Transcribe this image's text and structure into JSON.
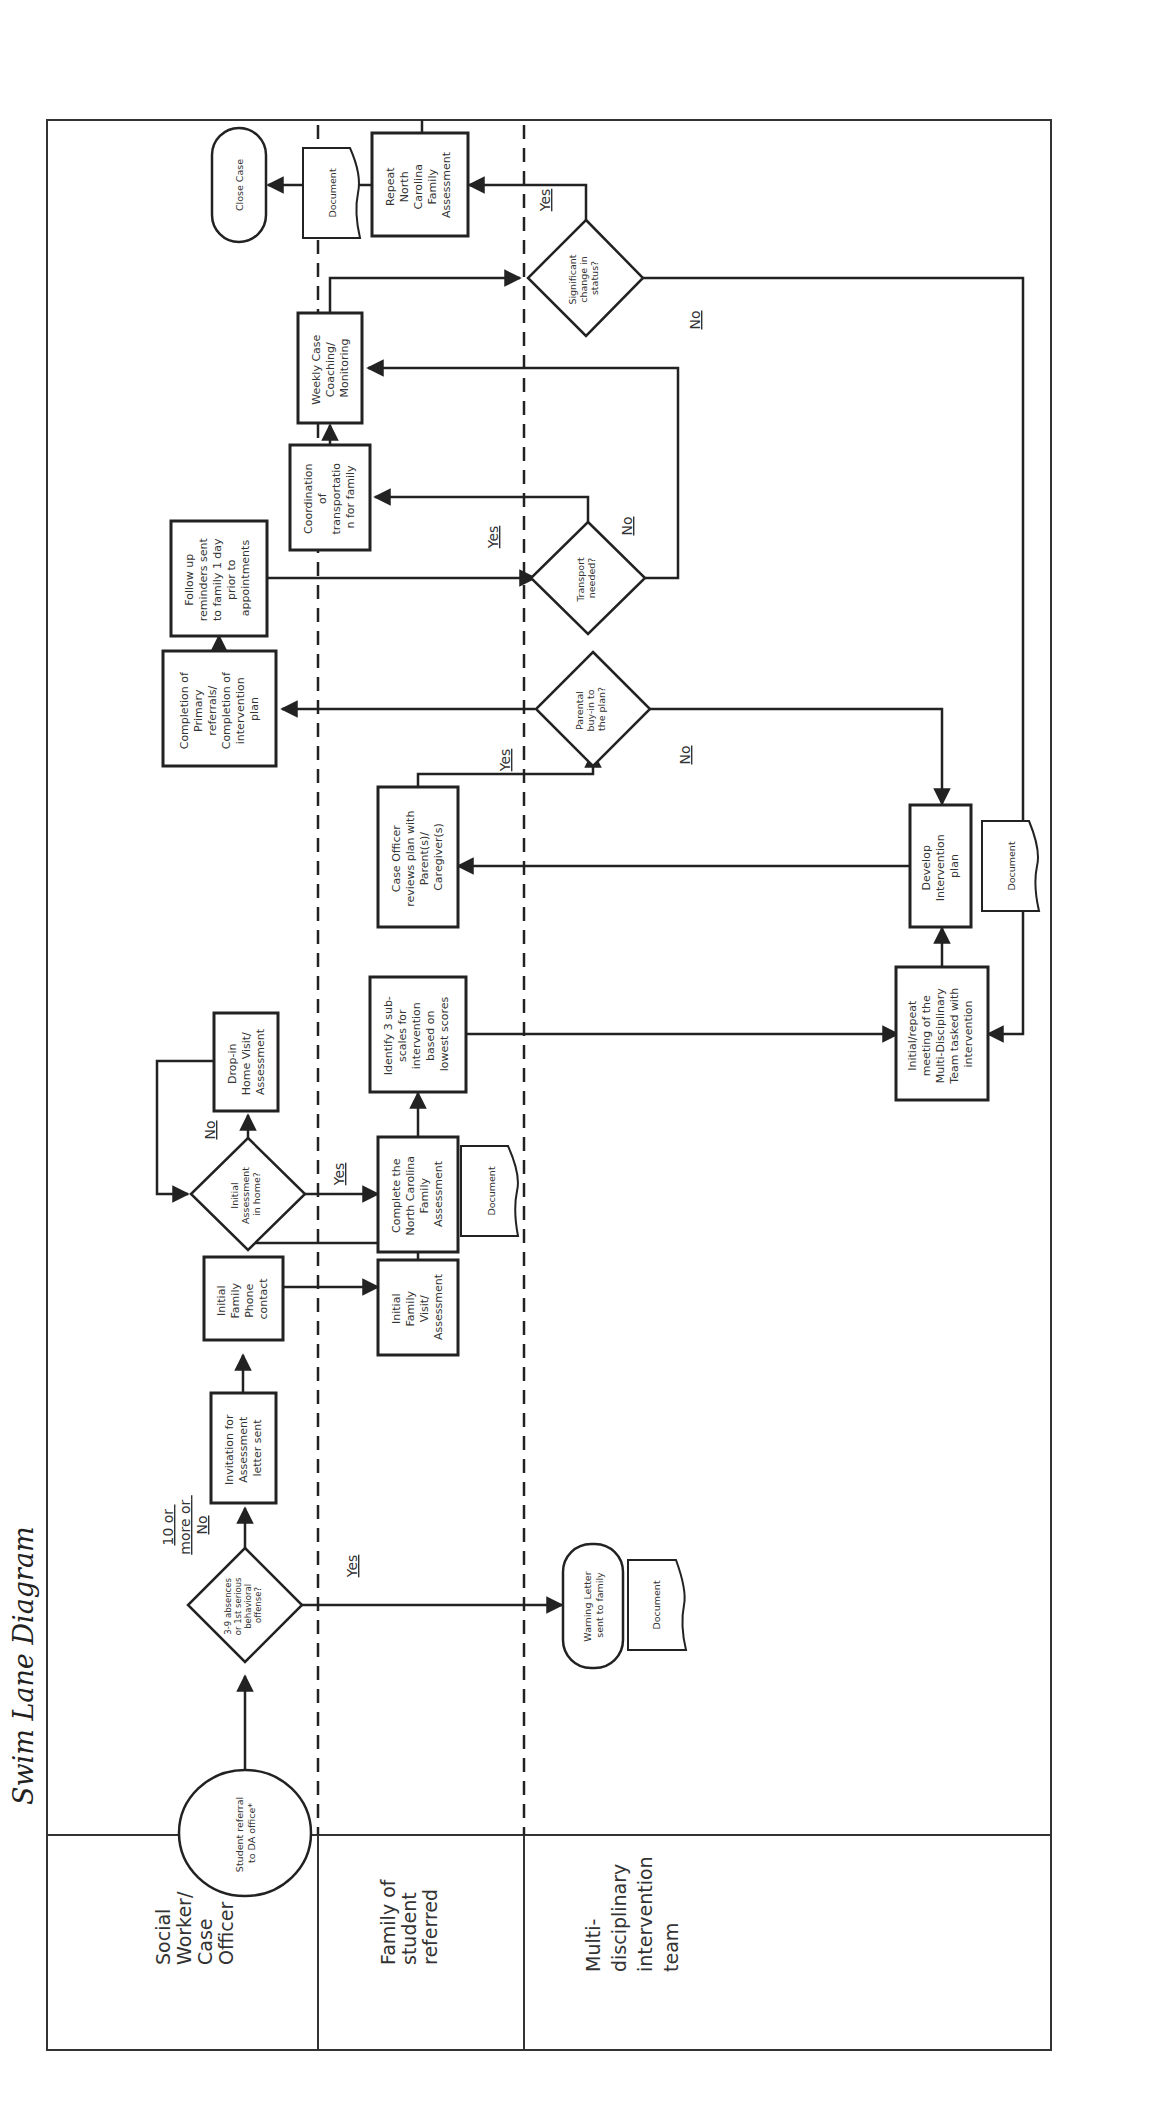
{
  "title": "Swim Lane Diagram",
  "lanes": [
    {
      "label": [
        "Social",
        "Worker/",
        "Case",
        "Officer"
      ]
    },
    {
      "label": [
        "Family of",
        "student",
        "referred"
      ]
    },
    {
      "label": [
        "Multi-",
        "disciplinary",
        "intervention",
        "team"
      ]
    }
  ],
  "nodes": {
    "start": {
      "shape": "circle",
      "lines": [
        "Student referral",
        "to DA office*"
      ]
    },
    "d_absences": {
      "shape": "diamond",
      "lines": [
        "3-9 absences",
        "or 1st serious",
        "behavioral",
        "offense?"
      ]
    },
    "invitation": {
      "shape": "process",
      "lines": [
        "Invitation for",
        "Assessment",
        "letter sent"
      ]
    },
    "phone": {
      "shape": "process",
      "lines": [
        "Initial",
        "Family",
        "Phone",
        "contact"
      ]
    },
    "visit": {
      "shape": "process",
      "lines": [
        "Initial",
        "Family",
        "Visit/",
        "Assessment"
      ]
    },
    "d_inhome": {
      "shape": "diamond",
      "lines": [
        "Initial",
        "Assessment",
        "in home?"
      ]
    },
    "dropin": {
      "shape": "process",
      "lines": [
        "Drop-in",
        "Home Visit/",
        "Assessment"
      ]
    },
    "ncfa": {
      "shape": "process",
      "lines": [
        "Complete the",
        "North Carolina",
        "Family",
        "Assessment"
      ]
    },
    "doc1": {
      "shape": "document",
      "lines": [
        "Document"
      ]
    },
    "identify": {
      "shape": "process",
      "lines": [
        "Identify 3 sub-",
        "scales for",
        "intervention",
        "based on",
        "lowest scores"
      ]
    },
    "review": {
      "shape": "process",
      "lines": [
        "Case Officer",
        "reviews plan with",
        "Parent(s)/",
        "Caregiver(s)"
      ]
    },
    "d_buyin": {
      "shape": "diamond",
      "lines": [
        "Parental",
        "buy-in to",
        "the plan?"
      ]
    },
    "completion": {
      "shape": "process",
      "lines": [
        "Completion of",
        "Primary",
        "referrals/",
        "Completion of",
        "intervention",
        "plan"
      ]
    },
    "followup": {
      "shape": "process",
      "lines": [
        "Follow up",
        "reminders sent",
        "to family 1 day",
        "prior to",
        "appointments"
      ]
    },
    "d_transport": {
      "shape": "diamond",
      "lines": [
        "Transport",
        "needed?"
      ]
    },
    "coordination": {
      "shape": "process",
      "lines": [
        "Coordination",
        "of",
        "transportatio",
        "n for family"
      ]
    },
    "weekly": {
      "shape": "process",
      "lines": [
        "Weekly Case",
        "Coaching/",
        "Monitoring"
      ]
    },
    "d_change": {
      "shape": "diamond",
      "lines": [
        "Significant",
        "change in",
        "status?"
      ]
    },
    "repeat": {
      "shape": "process",
      "lines": [
        "Repeat",
        "North",
        "Carolina",
        "Family",
        "Assessment"
      ]
    },
    "doc2": {
      "shape": "document",
      "lines": [
        "Document"
      ]
    },
    "close": {
      "shape": "terminator",
      "lines": [
        "Close Case"
      ]
    },
    "warning": {
      "shape": "terminator",
      "lines": [
        "Warning Letter",
        "sent to family"
      ]
    },
    "doc3": {
      "shape": "document",
      "lines": [
        "Document"
      ]
    },
    "mdt_meeting": {
      "shape": "process",
      "lines": [
        "Initial/repeat",
        "meeting of the",
        "Multi-Disciplinary",
        "Team tasked with",
        "intervention"
      ]
    },
    "develop": {
      "shape": "process",
      "lines": [
        "Develop",
        "Intervention",
        "plan"
      ]
    },
    "doc4": {
      "shape": "document",
      "lines": [
        "Document"
      ]
    }
  },
  "edge_labels": {
    "absences_no": [
      "10 or",
      "more or",
      "No"
    ],
    "absences_yes": "Yes",
    "inhome_no": "No",
    "inhome_yes": "Yes",
    "buyin_yes": "Yes",
    "buyin_no": "No",
    "transport_yes": "Yes",
    "transport_no": "No",
    "change_yes": "Yes",
    "change_no": "No"
  }
}
